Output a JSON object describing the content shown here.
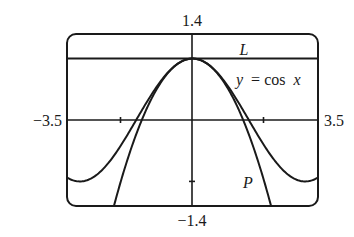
{
  "chart_data": {
    "type": "line",
    "title": "",
    "xlabel": "",
    "ylabel": "",
    "xlim": [
      -3.5,
      3.5
    ],
    "ylim": [
      -1.4,
      1.4
    ],
    "grid": false,
    "legend_position": "inline-labels",
    "axis_labels": {
      "ymax": "1.4",
      "ymin": "−1.4",
      "xmin": "−3.5",
      "xmax": "3.5"
    },
    "ticks": {
      "x": [
        -2,
        2
      ],
      "y": [
        -1
      ]
    },
    "series": [
      {
        "name": "L",
        "label": "L",
        "equation": "y = 1",
        "x": [
          -3.5,
          3.5
        ],
        "values": [
          1,
          1
        ]
      },
      {
        "name": "y = cos x",
        "label": "y = cos x",
        "equation": "y = cos x",
        "x": [
          -3.5,
          -3,
          -2,
          -1,
          0,
          1,
          2,
          3,
          3.5
        ],
        "values": [
          -0.936,
          -0.99,
          -0.416,
          0.54,
          1,
          0.54,
          -0.416,
          -0.99,
          -0.936
        ]
      },
      {
        "name": "P",
        "label": "P",
        "equation": "y = 1 - x^2/2",
        "x": [
          -2.28,
          -2,
          -1,
          0,
          1,
          2,
          2.28
        ],
        "values": [
          -1.4,
          -1,
          0.5,
          1,
          0.5,
          -1,
          -1.4
        ]
      }
    ]
  },
  "labels": {
    "top": "1.4",
    "bottom": "−1.4",
    "left": "−3.5",
    "right": "3.5",
    "L": "L",
    "cos_y": "y",
    "cos_eq": "= cos",
    "cos_x": "x",
    "P": "P"
  },
  "colors": {
    "ink": "#1a1a1a",
    "background": "#ffffff"
  }
}
